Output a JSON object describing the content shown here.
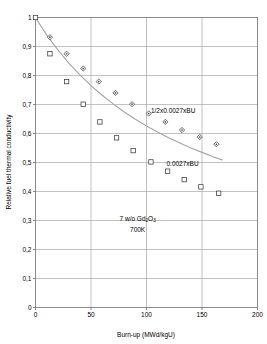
{
  "chart_data": {
    "type": "scatter",
    "title": "",
    "xlabel": "Burn-up (MWd/kgU)",
    "ylabel": "Relative fuel thermal conductivity",
    "xlim": [
      0,
      200
    ],
    "ylim": [
      0,
      1
    ],
    "xticks": [
      0,
      50,
      100,
      150,
      200
    ],
    "xtick_labels": [
      "0",
      "50",
      "100",
      "150",
      "200"
    ],
    "yticks": [
      0,
      0.1,
      0.2,
      0.3,
      0.4,
      0.5,
      0.6,
      0.7,
      0.8,
      0.9,
      1
    ],
    "ytick_labels": [
      "0",
      "0,1",
      "0,2",
      "0,3",
      "0,4",
      "0,5",
      "0,6",
      "0,7",
      "0,8",
      "0,9",
      "1"
    ],
    "grid": true,
    "legend_position": "inline-annotations",
    "series": [
      {
        "name": "1/2x0,0027xBU",
        "marker": "diamond",
        "color": "#4a4a4a",
        "points": [
          {
            "x": 13,
            "y": 0.932
          },
          {
            "x": 28,
            "y": 0.875
          },
          {
            "x": 43,
            "y": 0.824
          },
          {
            "x": 57,
            "y": 0.779
          },
          {
            "x": 72,
            "y": 0.74
          },
          {
            "x": 87,
            "y": 0.701
          },
          {
            "x": 102,
            "y": 0.669
          },
          {
            "x": 117,
            "y": 0.64
          },
          {
            "x": 132,
            "y": 0.612
          },
          {
            "x": 148,
            "y": 0.588
          },
          {
            "x": 163,
            "y": 0.563
          }
        ]
      },
      {
        "name": "0,0027xBU",
        "marker": "square",
        "color": "#3a3a3a",
        "points": [
          {
            "x": 0,
            "y": 1.0
          },
          {
            "x": 13,
            "y": 0.875
          },
          {
            "x": 28,
            "y": 0.779
          },
          {
            "x": 43,
            "y": 0.701
          },
          {
            "x": 58,
            "y": 0.64
          },
          {
            "x": 73,
            "y": 0.585
          },
          {
            "x": 88,
            "y": 0.541
          },
          {
            "x": 104,
            "y": 0.502
          },
          {
            "x": 119,
            "y": 0.47
          },
          {
            "x": 134,
            "y": 0.441
          },
          {
            "x": 149,
            "y": 0.416
          },
          {
            "x": 165,
            "y": 0.394
          }
        ]
      }
    ],
    "curve": {
      "name": "model-decay-curve",
      "color": "#a6a6a6",
      "points": [
        {
          "x": 0,
          "y": 1.0
        },
        {
          "x": 10,
          "y": 0.94
        },
        {
          "x": 20,
          "y": 0.889
        },
        {
          "x": 30,
          "y": 0.843
        },
        {
          "x": 40,
          "y": 0.802
        },
        {
          "x": 50,
          "y": 0.765
        },
        {
          "x": 60,
          "y": 0.732
        },
        {
          "x": 70,
          "y": 0.702
        },
        {
          "x": 80,
          "y": 0.674
        },
        {
          "x": 90,
          "y": 0.649
        },
        {
          "x": 100,
          "y": 0.626
        },
        {
          "x": 110,
          "y": 0.605
        },
        {
          "x": 120,
          "y": 0.585
        },
        {
          "x": 130,
          "y": 0.567
        },
        {
          "x": 140,
          "y": 0.55
        },
        {
          "x": 150,
          "y": 0.535
        },
        {
          "x": 160,
          "y": 0.52
        },
        {
          "x": 168,
          "y": 0.509
        }
      ]
    },
    "annotations": [
      {
        "id": "upper-series-label",
        "text": "1/2x0.0027xBU",
        "x": 104,
        "y": 0.669
      },
      {
        "id": "lower-series-label",
        "text": "0.0027xBU",
        "x": 118,
        "y": 0.487
      },
      {
        "id": "composition-label",
        "text_main_1": "7 w/o Gd",
        "text_sub_1": "2",
        "text_main_2": "O",
        "text_sub_2": "3",
        "x": 92,
        "y": 0.3
      },
      {
        "id": "temperature-label",
        "text": "700K",
        "x": 92,
        "y": 0.26
      }
    ]
  }
}
